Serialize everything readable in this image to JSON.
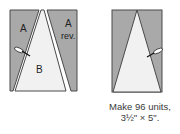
{
  "colors": {
    "gray_fabric": "#a9a9a9",
    "light_fabric": "#f1f1f1",
    "outline": "#4a4a4a",
    "text": "#3a3a3a"
  },
  "left_diagram": {
    "labels": {
      "piece_a": "A",
      "piece_b": "B",
      "piece_a_rev_line1": "A",
      "piece_a_rev_line2": "rev."
    },
    "icons": [
      "pin-icon"
    ]
  },
  "right_diagram": {
    "icons": [
      "pin-icon"
    ]
  },
  "caption": {
    "line1": "Make 96 units,",
    "line2": "3½\" × 5\"."
  }
}
